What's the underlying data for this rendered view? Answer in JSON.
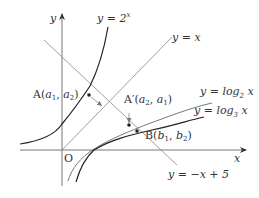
{
  "figure": {
    "axes": {
      "x_label": "x",
      "y_label": "y",
      "origin_label": "O"
    },
    "curves": [
      {
        "id": "exp2",
        "label_prefix": "y = 2",
        "label_sup": "x"
      },
      {
        "id": "identity",
        "label": "y = x"
      },
      {
        "id": "log2",
        "label_prefix": "y = log",
        "label_sub": "2",
        "label_suffix": " x"
      },
      {
        "id": "log3",
        "label_prefix": "y = log",
        "label_sub": "3",
        "label_suffix": " x"
      },
      {
        "id": "line",
        "label": "y = −x + 5"
      }
    ],
    "points": {
      "A": {
        "name": "A",
        "coords_open": "(",
        "c1": "a",
        "c1_sub": "1",
        "sep": ",  ",
        "c2": "a",
        "c2_sub": "2",
        "coords_close": ")"
      },
      "A_prime": {
        "name": "A′",
        "coords_open": "(",
        "c1": "a",
        "c1_sub": "2",
        "sep": ",  ",
        "c2": "a",
        "c2_sub": "1",
        "coords_close": ")"
      },
      "B": {
        "name": "B",
        "coords_open": "(",
        "c1": "b",
        "c1_sub": "1",
        "sep": ",  ",
        "c2": "b",
        "c2_sub": "2",
        "coords_close": ")"
      }
    },
    "colors": {
      "stroke_dark": "#222222",
      "stroke_light": "#777777",
      "text": "#333333"
    }
  }
}
